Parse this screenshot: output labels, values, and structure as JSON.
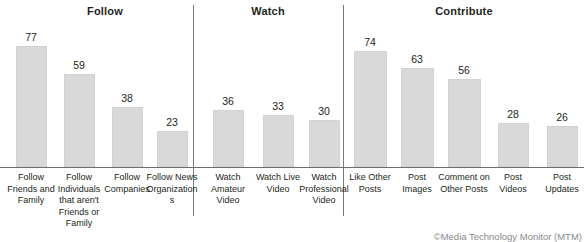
{
  "figure": {
    "background_color": "#ffffff",
    "bar_color": "#d9d9d9",
    "axis_color": "#6e6e6e",
    "separator_color": "#7b7b7b",
    "text_color": "#231f20",
    "watermark": "©Media Technology Monitor (MTM)"
  },
  "chart_data": {
    "type": "bar",
    "title": "",
    "subtitle": "",
    "xlabel": "",
    "ylabel": "",
    "ylim": [
      0,
      80
    ],
    "grid": false,
    "legend": null,
    "orientation": "vertical",
    "value_labels_shown": true,
    "groups": [
      {
        "name": "Follow",
        "categories": [
          "Follow Friends and Family",
          "Follow Individuals that aren't Friends or Family",
          "Follow Companies",
          "Follow News Organizations"
        ],
        "values": [
          77,
          59,
          38,
          23
        ]
      },
      {
        "name": "Watch",
        "categories": [
          "Watch Amateur Video",
          "Watch Live Video",
          "Watch Professional Video"
        ],
        "values": [
          36,
          33,
          30
        ]
      },
      {
        "name": "Contribute",
        "categories": [
          "Like Other Posts",
          "Post Images",
          "Comment on Other Posts",
          "Post Videos",
          "Post Updates"
        ],
        "values": [
          74,
          63,
          56,
          28,
          26
        ]
      }
    ],
    "categories": [
      "Follow Friends and Family",
      "Follow Individuals that aren't Friends or Family",
      "Follow Companies",
      "Follow News Organizations",
      "Watch Amateur Video",
      "Watch Live Video",
      "Watch Professional Video",
      "Like Other Posts",
      "Post Images",
      "Comment on Other Posts",
      "Post Videos",
      "Post Updates"
    ],
    "values": [
      77,
      59,
      38,
      23,
      36,
      33,
      30,
      74,
      63,
      56,
      28,
      26
    ]
  },
  "layout": {
    "separators_x": [
      193,
      343
    ],
    "baseline_y": 167,
    "section_title_positions": [
      105,
      268,
      464
    ],
    "bars": [
      {
        "key": "follow-friends-and-family",
        "group": 0,
        "cx": 31,
        "width": 31,
        "value": 77
      },
      {
        "key": "follow-individuals",
        "group": 0,
        "cx": 79,
        "width": 31,
        "value": 59
      },
      {
        "key": "follow-companies",
        "group": 0,
        "cx": 127,
        "width": 31,
        "value": 38
      },
      {
        "key": "follow-news-organizations",
        "group": 0,
        "cx": 172,
        "width": 31,
        "value": 23
      },
      {
        "key": "watch-amateur-video",
        "group": 1,
        "cx": 228,
        "width": 31,
        "value": 36
      },
      {
        "key": "watch-live-video",
        "group": 1,
        "cx": 278,
        "width": 31,
        "value": 33
      },
      {
        "key": "watch-professional-video",
        "group": 1,
        "cx": 324,
        "width": 31,
        "value": 30
      },
      {
        "key": "like-other-posts",
        "group": 2,
        "cx": 370,
        "width": 33,
        "value": 74
      },
      {
        "key": "post-images",
        "group": 2,
        "cx": 417,
        "width": 33,
        "value": 63
      },
      {
        "key": "comment-on-other-posts",
        "group": 2,
        "cx": 464,
        "width": 33,
        "value": 56
      },
      {
        "key": "post-videos",
        "group": 2,
        "cx": 513,
        "width": 31,
        "value": 28
      },
      {
        "key": "post-updates",
        "group": 2,
        "cx": 562,
        "width": 31,
        "value": 26
      }
    ],
    "label_widths": [
      48,
      58,
      48,
      52,
      48,
      58,
      56,
      56,
      42,
      56,
      42,
      46
    ]
  }
}
